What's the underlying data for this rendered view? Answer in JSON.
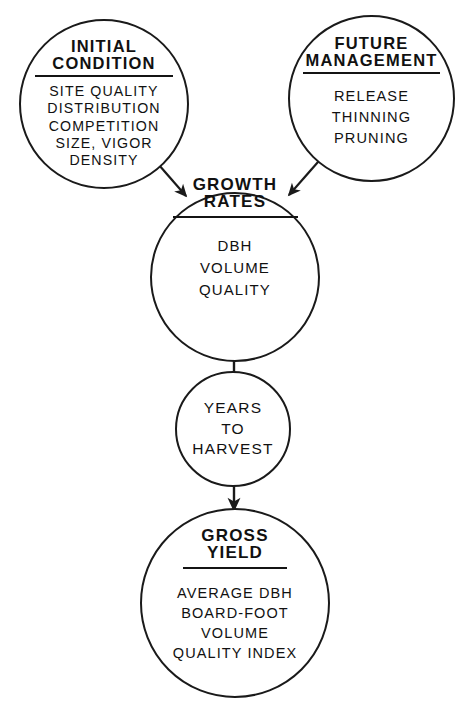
{
  "diagram": {
    "background_color": "#ffffff",
    "line_color": "#1a1a1a",
    "nodes": [
      {
        "id": "initial-condition",
        "title": "INITIAL\nCONDITION",
        "body": "SITE  QUALITY\nDISTRIBUTION\nCOMPETITION\nSIZE, VIGOR\nDENSITY",
        "shape": "circle"
      },
      {
        "id": "future-management",
        "title": "FUTURE\nMANAGEMENT",
        "body": "RELEASE\nTHINNING\nPRUNING",
        "shape": "circle"
      },
      {
        "id": "growth-rates",
        "title": "GROWTH\nRATES",
        "body": "DBH\nVOLUME\nQUALITY",
        "shape": "circle"
      },
      {
        "id": "years-to-harvest",
        "title": "YEARS\nTO\nHARVEST",
        "body": "",
        "shape": "circle"
      },
      {
        "id": "gross-yield",
        "title": "GROSS\nYIELD",
        "body": "AVERAGE DBH\nBOARD-FOOT\nVOLUME\nQUALITY INDEX",
        "shape": "circle"
      }
    ],
    "edges": [
      {
        "id": "edge-initial-to-growth",
        "from": "initial-condition",
        "to": "growth-rates",
        "style": "arrow-diagonal"
      },
      {
        "id": "edge-future-to-growth",
        "from": "future-management",
        "to": "growth-rates",
        "style": "arrow-diagonal"
      },
      {
        "id": "edge-growth-to-years",
        "from": "growth-rates",
        "to": "years-to-harvest",
        "style": "plain-line"
      },
      {
        "id": "edge-years-to-gross",
        "from": "years-to-harvest",
        "to": "gross-yield",
        "style": "arrow-vertical"
      }
    ],
    "caption": ""
  }
}
